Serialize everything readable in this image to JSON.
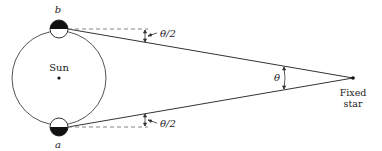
{
  "diagram": {
    "type": "parallax-geometry",
    "labels": {
      "sun": "Sun",
      "earth_top": "b",
      "earth_bottom": "a",
      "half_angle_top": "θ/2",
      "half_angle_bottom": "θ/2",
      "angle": "θ",
      "star_line1": "Fixed",
      "star_line2": "star"
    },
    "colors": {
      "stroke": "#333333",
      "fill_dark": "#111111",
      "dashed": "#777777"
    }
  }
}
